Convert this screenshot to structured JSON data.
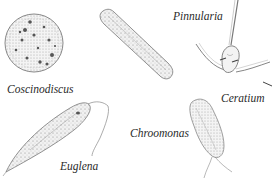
{
  "figure": {
    "background_color": "#ffffff",
    "ink_color": "#555555",
    "organisms": [
      {
        "id": "coscinodiscus",
        "label": "Coscinodiscus",
        "shape": "disc with dotted pores"
      },
      {
        "id": "pinnularia",
        "label": "Pinnularia",
        "shape": "elongated rod diatom"
      },
      {
        "id": "ceratium",
        "label": "Ceratium",
        "shape": "horned dinoflagellate"
      },
      {
        "id": "chroomonas",
        "label": "Chroomonas",
        "shape": "oval cell with flagella"
      },
      {
        "id": "euglena",
        "label": "Euglena",
        "shape": "spindle cell with flagellum"
      }
    ]
  }
}
